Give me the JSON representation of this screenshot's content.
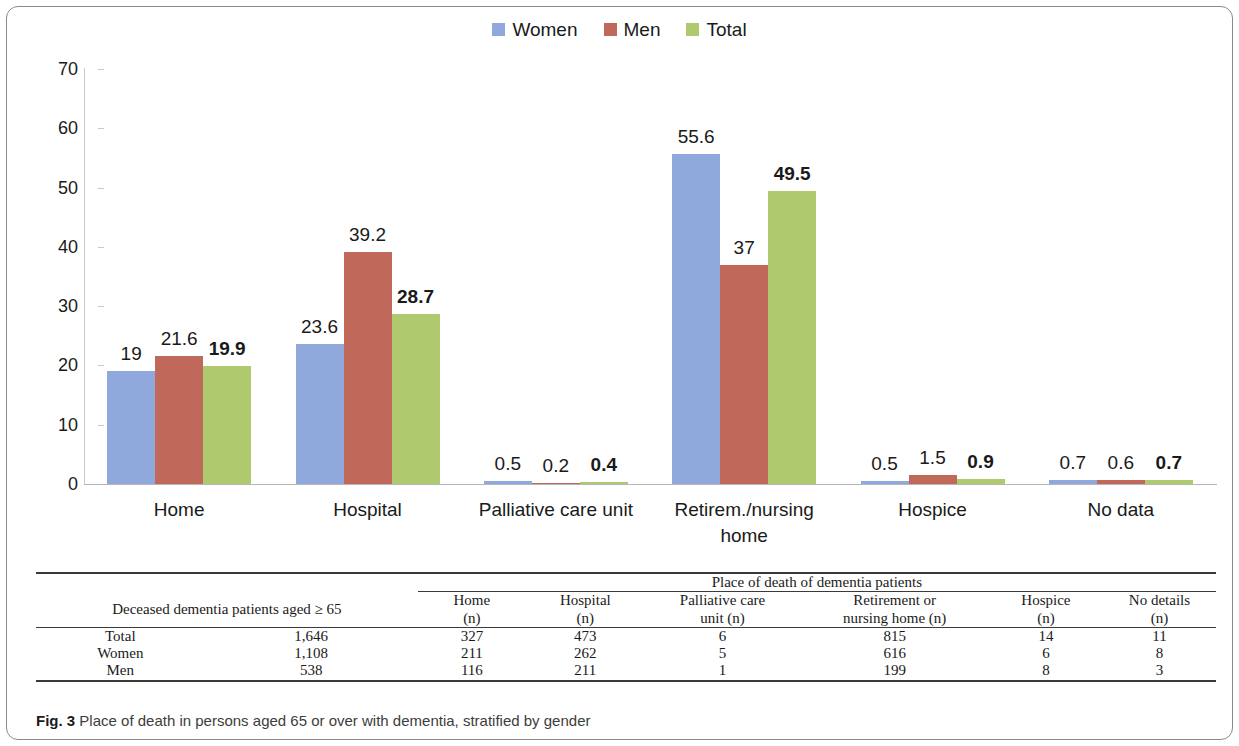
{
  "figure": {
    "caption_prefix": "Fig. 3",
    "caption_text": "Place of death in persons aged 65 or over with dementia, stratified by gender"
  },
  "colors": {
    "women": "#8FA9DC",
    "men": "#C0685A",
    "total": "#AFC96E",
    "axis": "#c9c9c9",
    "text": "#1a1a1a"
  },
  "chart_data": {
    "type": "bar",
    "title": "",
    "xlabel": "",
    "ylabel": "",
    "ylim": [
      0,
      70
    ],
    "yticks": [
      0,
      10,
      20,
      30,
      40,
      50,
      60,
      70
    ],
    "grid": false,
    "legend_position": "top-center",
    "categories": [
      "Home",
      "Hospital",
      "Palliative care unit",
      "Retirem./nursing home",
      "Hospice",
      "No data"
    ],
    "series": [
      {
        "name": "Women",
        "color": "#8FA9DC",
        "values": [
          19,
          23.6,
          0.5,
          55.6,
          0.5,
          0.7
        ],
        "labels": [
          "19",
          "23.6",
          "0.5",
          "55.6",
          "0.5",
          "0.7"
        ]
      },
      {
        "name": "Men",
        "color": "#C0685A",
        "values": [
          21.6,
          39.2,
          0.2,
          37,
          1.5,
          0.6
        ],
        "labels": [
          "21.6",
          "39.2",
          "0.2",
          "37",
          "1.5",
          "0.6"
        ]
      },
      {
        "name": "Total",
        "color": "#AFC96E",
        "values": [
          19.9,
          28.7,
          0.4,
          49.5,
          0.9,
          0.7
        ],
        "labels": [
          "19.9",
          "28.7",
          "0.4",
          "49.5",
          "0.9",
          "0.7"
        ]
      }
    ]
  },
  "legend": {
    "items": [
      {
        "label": "Women",
        "color": "#8FA9DC"
      },
      {
        "label": "Men",
        "color": "#C0685A"
      },
      {
        "label": "Total",
        "color": "#AFC96E"
      }
    ]
  },
  "axis": {
    "y_tick_labels": [
      "70",
      "60",
      "50",
      "40",
      "30",
      "20",
      "10",
      "0"
    ],
    "category_labels": [
      "Home",
      "Hospital",
      "Palliative care unit",
      "Retirem./nursing home",
      "Hospice",
      "No data"
    ]
  },
  "table": {
    "group_header": "Place of death of dementia patients",
    "row_group_header": "Deceased dementia patients aged ≥ 65",
    "column_headers": [
      {
        "line1": "Home",
        "line2": "(n)"
      },
      {
        "line1": "Hospital",
        "line2": "(n)"
      },
      {
        "line1": "Palliative care",
        "line2": "unit (n)"
      },
      {
        "line1": "Retirement or",
        "line2": "nursing home (n)"
      },
      {
        "line1": "Hospice",
        "line2": "(n)"
      },
      {
        "line1": "No details",
        "line2": "(n)"
      }
    ],
    "rows": [
      {
        "label": "Total",
        "n": "1,646",
        "cells": [
          "327",
          "473",
          "6",
          "815",
          "14",
          "11"
        ]
      },
      {
        "label": "Women",
        "n": "1,108",
        "cells": [
          "211",
          "262",
          "5",
          "616",
          "6",
          "8"
        ]
      },
      {
        "label": "Men",
        "n": "538",
        "cells": [
          "116",
          "211",
          "1",
          "199",
          "8",
          "3"
        ]
      }
    ]
  }
}
